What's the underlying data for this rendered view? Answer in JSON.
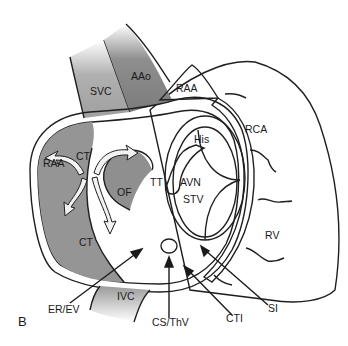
{
  "figure": {
    "panel_label": "B"
  },
  "labels": {
    "svc": "SVC",
    "aao": "AAo",
    "raa_top": "RAA",
    "rca": "RCA",
    "raa_left": "RAA",
    "ct_top": "CT",
    "ct_bottom": "CT",
    "his": "His",
    "tt": "TT",
    "avn": "AVN",
    "stv": "STV",
    "of": "OF",
    "rv": "RV",
    "ivc": "IVC",
    "er_ev": "ER/EV",
    "cs_thv": "CS/ThV",
    "cti": "CTI",
    "si": "SI"
  },
  "colors": {
    "outer_heart": "#8a8a8a",
    "vessel_svc": "#a6a6a6",
    "vessel_aao": "#8c8c8c",
    "atrium_rim": "#bdbdbd",
    "atrium_floor": "#a9a9a9",
    "raa_pectinate": "#959595",
    "rca_band": "#6e6e6e",
    "tricuspid_ring": "#c9c9c9",
    "stv_inner": "#b8b8b8",
    "fossa_ovalis": "#8f8f8f",
    "outline": "#1f1f1f",
    "white_arrow": "#f2f2f2"
  }
}
